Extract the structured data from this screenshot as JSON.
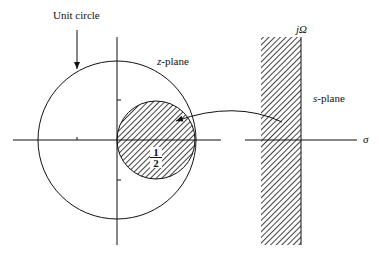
{
  "diagram": {
    "labels": {
      "unit_circle": "Unit circle",
      "z_plane_var": "z",
      "z_plane_suffix": "-plane",
      "s_plane_var": "s",
      "s_plane_suffix": "-plane",
      "j_omega": "jΩ",
      "sigma": "σ",
      "half_num": "1",
      "half_den": "2"
    },
    "colors": {
      "ink": "#111111",
      "background": "#ffffff"
    }
  }
}
